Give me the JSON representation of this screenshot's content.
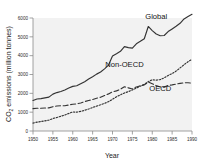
{
  "chart_data": {
    "type": "line",
    "title": "",
    "xlabel": "Year",
    "ylabel": "CO2 emissions (million tonnes)",
    "ylabel_main": "CO",
    "ylabel_sub": "2",
    "ylabel_rest": " emissions (million tonnes)",
    "xlim": [
      1950,
      1990
    ],
    "ylim": [
      0,
      6000
    ],
    "grid": false,
    "legend_position": "inline-annotations",
    "xticks": [
      1950,
      1955,
      1960,
      1965,
      1970,
      1975,
      1980,
      1985,
      1990
    ],
    "xtick_labels": [
      "1950",
      "1955",
      "1960",
      "1965",
      "1970",
      "1975",
      "1980",
      "1985",
      "1990"
    ],
    "yticks": [
      0,
      1000,
      2000,
      3000,
      4000,
      5000,
      6000
    ],
    "ytick_labels": [
      "0",
      "1000",
      "2000",
      "3000",
      "4000",
      "5000",
      "6000"
    ],
    "x": [
      1950,
      1951,
      1952,
      1953,
      1954,
      1955,
      1956,
      1957,
      1958,
      1959,
      1960,
      1961,
      1962,
      1963,
      1964,
      1965,
      1966,
      1967,
      1968,
      1969,
      1970,
      1971,
      1972,
      1973,
      1974,
      1975,
      1976,
      1977,
      1978,
      1979,
      1980,
      1981,
      1982,
      1983,
      1984,
      1985,
      1986,
      1987,
      1988,
      1989,
      1990
    ],
    "series": [
      {
        "name": "Global",
        "style": "solid",
        "color": "#333333",
        "label_x": 1981,
        "label_y": 5950,
        "values": [
          1620,
          1700,
          1720,
          1760,
          1800,
          1960,
          2040,
          2100,
          2180,
          2280,
          2370,
          2400,
          2510,
          2620,
          2760,
          2880,
          3020,
          3130,
          3300,
          3500,
          3980,
          4100,
          4230,
          4480,
          4430,
          4400,
          4630,
          4760,
          4900,
          5550,
          5330,
          5150,
          5060,
          5070,
          5280,
          5420,
          5560,
          5720,
          5950,
          6080,
          6200
        ]
      },
      {
        "name": "Non-OECD",
        "style": "dotted",
        "color": "#333333",
        "label_x": 1973,
        "label_y": 3400,
        "values": [
          420,
          470,
          500,
          540,
          580,
          660,
          720,
          780,
          850,
          930,
          1010,
          1000,
          1040,
          1100,
          1170,
          1250,
          1320,
          1390,
          1470,
          1560,
          1680,
          1820,
          1920,
          2020,
          2090,
          2180,
          2280,
          2380,
          2480,
          2620,
          2720,
          2700,
          2730,
          2820,
          2950,
          3050,
          3180,
          3350,
          3520,
          3680,
          3800
        ]
      },
      {
        "name": "OECD",
        "style": "dashed",
        "color": "#333333",
        "label_x": 1982,
        "label_y": 2150,
        "values": [
          1190,
          1210,
          1210,
          1220,
          1230,
          1290,
          1330,
          1340,
          1340,
          1380,
          1420,
          1440,
          1490,
          1560,
          1620,
          1670,
          1740,
          1790,
          1880,
          1970,
          2080,
          2130,
          2220,
          2350,
          2290,
          2230,
          2340,
          2400,
          2450,
          2600,
          2510,
          2410,
          2340,
          2330,
          2420,
          2450,
          2490,
          2530,
          2560,
          2560,
          2540
        ]
      }
    ]
  },
  "axis": {
    "x_title": "Year",
    "y_title_prefix": "CO",
    "y_title_sub": "2",
    "y_title_suffix": " emissions (million tonnes)"
  }
}
